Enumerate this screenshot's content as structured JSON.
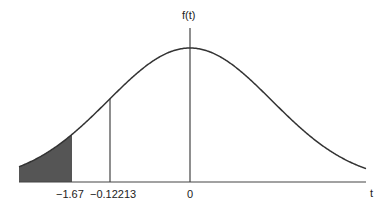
{
  "chart_data": {
    "type": "area",
    "title": "",
    "xlabel": "t",
    "ylabel": "f(t)",
    "x_tick_labels": [
      "-1.67",
      "-0.12213",
      "0"
    ],
    "x_ticks": [
      -1.67,
      -0.12213,
      0
    ],
    "shaded_region": {
      "from": "-inf",
      "to": -1.67,
      "color": "#555555"
    },
    "reference_lines": [
      {
        "x": -0.12213
      },
      {
        "x": 0,
        "role": "y-axis"
      }
    ],
    "grid": false,
    "legend": null
  },
  "labels": {
    "y_axis": "f(t)",
    "x_axis": "t",
    "tick_shade": "−1.67",
    "tick_ref": "−0.12213",
    "tick_zero": "0"
  },
  "colors": {
    "curve": "#333333",
    "shade": "#555555",
    "axis": "#444444"
  }
}
